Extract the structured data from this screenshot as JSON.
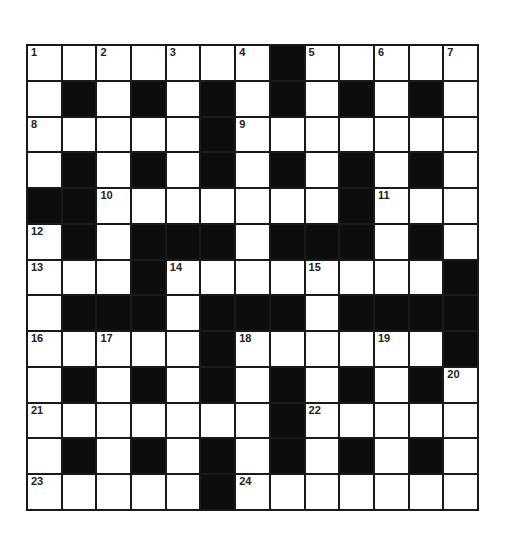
{
  "puzzle": {
    "rows": 13,
    "cols": 13,
    "grid": [
      ".......#.....",
      ".#.#.#.#.#.#.",
      ".....#.......",
      ".#.#.#.#.#.#.",
      "##.......#...",
      ".#.###.###.#.",
      "...#........#",
      ".###.###.####",
      ".....#......#",
      ".#.#.#.#.#.#.",
      ".......#.....",
      ".#.#.#.#.#.#.",
      ".....#......."
    ],
    "numbers": [
      {
        "n": "1",
        "r": 0,
        "c": 0
      },
      {
        "n": "2",
        "r": 0,
        "c": 2
      },
      {
        "n": "3",
        "r": 0,
        "c": 4
      },
      {
        "n": "4",
        "r": 0,
        "c": 6
      },
      {
        "n": "5",
        "r": 0,
        "c": 8
      },
      {
        "n": "6",
        "r": 0,
        "c": 10
      },
      {
        "n": "7",
        "r": 0,
        "c": 12
      },
      {
        "n": "8",
        "r": 2,
        "c": 0
      },
      {
        "n": "9",
        "r": 2,
        "c": 6
      },
      {
        "n": "10",
        "r": 4,
        "c": 2
      },
      {
        "n": "11",
        "r": 4,
        "c": 10
      },
      {
        "n": "12",
        "r": 5,
        "c": 0
      },
      {
        "n": "13",
        "r": 6,
        "c": 0
      },
      {
        "n": "14",
        "r": 6,
        "c": 4
      },
      {
        "n": "15",
        "r": 6,
        "c": 8
      },
      {
        "n": "16",
        "r": 8,
        "c": 0
      },
      {
        "n": "17",
        "r": 8,
        "c": 2
      },
      {
        "n": "18",
        "r": 8,
        "c": 6
      },
      {
        "n": "19",
        "r": 8,
        "c": 10
      },
      {
        "n": "20",
        "r": 9,
        "c": 12
      },
      {
        "n": "21",
        "r": 10,
        "c": 0
      },
      {
        "n": "22",
        "r": 10,
        "c": 8
      },
      {
        "n": "23",
        "r": 12,
        "c": 0
      },
      {
        "n": "24",
        "r": 12,
        "c": 6
      }
    ],
    "colors": {
      "block": "#0d0d0d",
      "cell": "#ffffff",
      "line": "#1a1a1a"
    }
  }
}
